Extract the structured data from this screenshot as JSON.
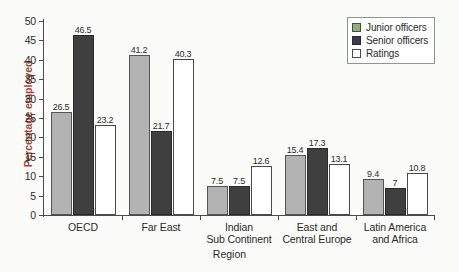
{
  "chart_data": {
    "type": "bar",
    "title": "",
    "xlabel": "Region",
    "ylabel": "Percentage employed",
    "ylim": [
      0,
      50
    ],
    "ytick_step": 5,
    "yticks": [
      "50",
      "45",
      "40",
      "35",
      "30",
      "25",
      "20",
      "15",
      "10",
      "5",
      "0"
    ],
    "grid": false,
    "legend_position": "top-right",
    "categories": [
      "OECD",
      "Far East",
      "Indian Sub Continent",
      "East and Central Europe",
      "Latin America and Africa"
    ],
    "category_lines": [
      [
        "OECD"
      ],
      [
        "Far East"
      ],
      [
        "Indian",
        "Sub Continent"
      ],
      [
        "East and",
        "Central Europe"
      ],
      [
        "Latin America",
        "and Africa"
      ]
    ],
    "series": [
      {
        "name": "Junior officers",
        "key": "junior",
        "color": "#b3b3b3",
        "legend_color": "#8fae7c",
        "values": [
          26.5,
          41.2,
          7.5,
          15.4,
          9.4
        ],
        "labels": [
          "26.5",
          "41.2",
          "7.5",
          "15.4",
          "9.4"
        ]
      },
      {
        "name": "Senior officers",
        "key": "senior",
        "color": "#3f3f3f",
        "legend_color": "#3a3a52",
        "values": [
          46.5,
          21.7,
          7.5,
          17.3,
          7
        ],
        "labels": [
          "46.5",
          "21.7",
          "7.5",
          "17.3",
          "7"
        ]
      },
      {
        "name": "Ratings",
        "key": "ratings",
        "color": "#ffffff",
        "legend_color": "#ffffff",
        "values": [
          23.2,
          40.3,
          12.6,
          13.1,
          10.8
        ],
        "labels": [
          "23.2",
          "40.3",
          "12.6",
          "13.1",
          "10.8"
        ]
      }
    ]
  },
  "axis": {
    "y_title": "Percentage employed",
    "x_title": "Region",
    "y_title_color": "#9c4a3c"
  },
  "legend": {
    "items": [
      {
        "label": "Junior officers"
      },
      {
        "label": "Senior officers"
      },
      {
        "label": "Ratings"
      }
    ]
  }
}
